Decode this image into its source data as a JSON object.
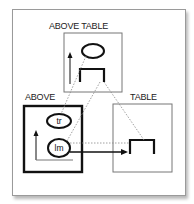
{
  "diagram": {
    "labels": {
      "above_table": "ABOVE TABLE",
      "above": "ABOVE",
      "table": "TABLE"
    },
    "nodes": {
      "tr": "tr",
      "lm": "lm"
    },
    "colors": {
      "stroke": "#111111",
      "thin_stroke": "#777777",
      "dotted": "#888888",
      "frame_border": "#9a9a9a",
      "background": "#ffffff"
    }
  }
}
